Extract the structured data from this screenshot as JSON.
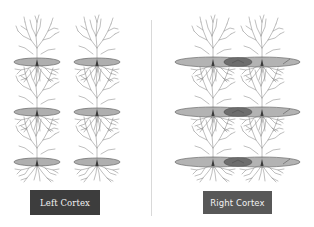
{
  "diagram": {
    "panels": [
      {
        "id": "left",
        "label": "Left Cortex",
        "neuron_columns_x": [
          37,
          97
        ],
        "rows_y": [
          62,
          112,
          162
        ],
        "ellipses": "separate",
        "ellipse_fill": "#a6a6a6"
      },
      {
        "id": "right",
        "label": "Right Cortex",
        "neuron_columns_x": [
          213,
          262
        ],
        "rows_y": [
          62,
          112,
          162
        ],
        "ellipses": "merged",
        "ellipse_fill": "#a6a6a6",
        "overlap_fill": "#6e6e6e"
      }
    ],
    "colors": {
      "background": "#ffffff",
      "dendrite": "#8a8a8a",
      "ellipse_stroke": "#555555",
      "divider": "#d9d9d9",
      "left_button": "#3d3d3d",
      "right_button": "#585858",
      "button_text": "#f2f2f2"
    }
  },
  "buttons": {
    "left_label": "Left Cortex",
    "right_label": "Right Cortex"
  }
}
